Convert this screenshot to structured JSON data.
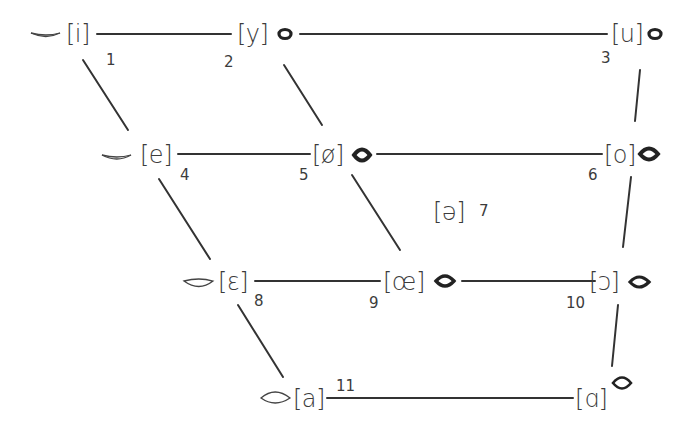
{
  "diagram": {
    "type": "vowel-quadrilateral",
    "line_color": "#333333",
    "vowels": [
      {
        "id": 1,
        "symbol": "[i]",
        "number": "1",
        "lips": "spread"
      },
      {
        "id": 2,
        "symbol": "[y]",
        "number": "2",
        "lips": "rounded"
      },
      {
        "id": 3,
        "symbol": "[u]",
        "number": "3",
        "lips": "rounded"
      },
      {
        "id": 4,
        "symbol": "[e]",
        "number": "4",
        "lips": "spread"
      },
      {
        "id": 5,
        "symbol": "[ø]",
        "number": "5",
        "lips": "rounded"
      },
      {
        "id": 6,
        "symbol": "[o]",
        "number": "6",
        "lips": "rounded"
      },
      {
        "id": 7,
        "symbol": "[ə]",
        "number": "7",
        "lips": "none"
      },
      {
        "id": 8,
        "symbol": "[ɛ]",
        "number": "8",
        "lips": "half-open-spread"
      },
      {
        "id": 9,
        "symbol": "[œ]",
        "number": "9",
        "lips": "rounded"
      },
      {
        "id": 10,
        "symbol": "[ɔ]",
        "number": "10",
        "lips": "rounded"
      },
      {
        "id": 11,
        "symbol": "[a]",
        "number": "11",
        "lips": "open"
      },
      {
        "id": 12,
        "symbol": "[ɑ]",
        "number": "",
        "lips": "open-rounded"
      }
    ],
    "connections": [
      [
        "i",
        "y"
      ],
      [
        "y",
        "u"
      ],
      [
        "e",
        "ø"
      ],
      [
        "ø",
        "o"
      ],
      [
        "ɛ",
        "œ"
      ],
      [
        "œ",
        "ɔ"
      ],
      [
        "a",
        "ɑ"
      ],
      [
        "i",
        "e"
      ],
      [
        "e",
        "ɛ"
      ],
      [
        "ɛ",
        "a"
      ],
      [
        "y",
        "ø"
      ],
      [
        "ø",
        "œ"
      ],
      [
        "u",
        "o"
      ],
      [
        "o",
        "ɔ"
      ],
      [
        "ɔ",
        "ɑ"
      ]
    ]
  }
}
